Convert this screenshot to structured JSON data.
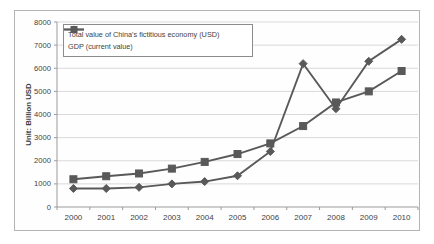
{
  "chart_data": {
    "type": "line",
    "title": "",
    "xlabel": "",
    "ylabel": "Unit: Billion USD",
    "categories": [
      "2000",
      "2001",
      "2002",
      "2003",
      "2004",
      "2005",
      "2006",
      "2007",
      "2008",
      "2009",
      "2010"
    ],
    "series": [
      {
        "name": "Total value of China's fictitious economy (USD)",
        "marker": "diamond",
        "values": [
          800,
          800,
          850,
          1000,
          1100,
          1350,
          2400,
          6200,
          4250,
          6300,
          7250
        ]
      },
      {
        "name": "GDP (current value)",
        "marker": "square",
        "values": [
          1200,
          1330,
          1450,
          1660,
          1950,
          2290,
          2750,
          3500,
          4520,
          5000,
          5880
        ]
      }
    ],
    "ylim": [
      0,
      8000
    ],
    "ytick_step": 1000,
    "yticks": [
      "0",
      "1000",
      "2000",
      "3000",
      "4000",
      "5000",
      "6000",
      "7000",
      "8000"
    ],
    "grid": "horizontal",
    "legend_position": "top-left",
    "colors": {
      "series": "#595959",
      "gridline": "#d9d9d9",
      "axis": "#9b9b9b",
      "text": "#3f3f3f",
      "frame_border": "#b4b4b4",
      "background": "#ffffff"
    }
  }
}
